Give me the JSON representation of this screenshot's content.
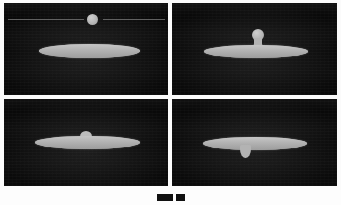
{
  "figure": {
    "caption": "",
    "background_color": "#fdfdfd",
    "frame_background_color": "#090909",
    "liquid_color": "#b3b3b3",
    "reference_line_color": "#6e6e6e",
    "panel_count": 4,
    "grid": "2x2"
  },
  "panels": [
    {
      "id": "panel-a",
      "position": "top-left",
      "stage_label": "approach",
      "description": "A free spherical droplet hovers above a wide flat liquid lamella; a thin horizontal reference line crosses the frame at the droplet height.",
      "has_reference_line": true,
      "has_free_droplet": true,
      "droplet_state": "detached",
      "lamella_profile": "flat-ellipse"
    },
    {
      "id": "panel-b",
      "position": "top-right",
      "stage_label": "contact",
      "description": "The droplet has touched the lamella surface and a narrow liquid neck has formed between them.",
      "has_reference_line": false,
      "has_free_droplet": false,
      "droplet_state": "necking",
      "lamella_profile": "flat-ellipse-with-neck"
    },
    {
      "id": "panel-c",
      "position": "bottom-left",
      "stage_label": "merging",
      "description": "The droplet has almost fully drained into the lamella, leaving only a small residual bump on the upper surface.",
      "has_reference_line": false,
      "has_free_droplet": false,
      "droplet_state": "absorbed",
      "lamella_profile": "flat-ellipse-with-bump"
    },
    {
      "id": "panel-d",
      "position": "bottom-right",
      "stage_label": "pinch-off",
      "description": "A secondary pendant droplet now protrudes downward from the underside of the lamella.",
      "has_reference_line": false,
      "has_free_droplet": false,
      "droplet_state": "pendant-below",
      "lamella_profile": "flat-ellipse-with-pendant"
    }
  ],
  "caption_markers": [
    {
      "id": "marker-left",
      "shape": "filled-rectangle"
    },
    {
      "id": "marker-right",
      "shape": "filled-rectangle-small"
    }
  ]
}
